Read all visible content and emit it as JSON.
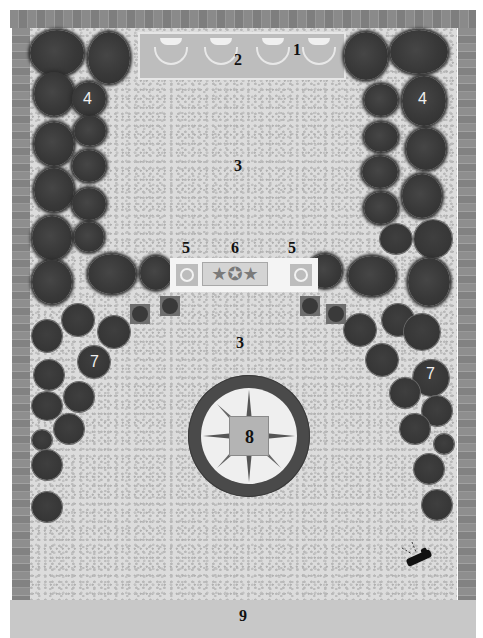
{
  "diagram": {
    "title": "",
    "type": "garden-plan",
    "labels": [
      {
        "id": "1",
        "text": "1",
        "element": "wall-fountains"
      },
      {
        "id": "2",
        "text": "2",
        "element": "raised-planter"
      },
      {
        "id": "3a",
        "text": "3",
        "element": "gravel-upper"
      },
      {
        "id": "3b",
        "text": "3",
        "element": "gravel-lower"
      },
      {
        "id": "4a",
        "text": "4",
        "element": "shrub-left"
      },
      {
        "id": "4b",
        "text": "4",
        "element": "shrub-right"
      },
      {
        "id": "5a",
        "text": "5",
        "element": "urn-left"
      },
      {
        "id": "5b",
        "text": "5",
        "element": "urn-right"
      },
      {
        "id": "6",
        "text": "6",
        "element": "sculpture-panel"
      },
      {
        "id": "7a",
        "text": "7",
        "element": "round-shrub-left"
      },
      {
        "id": "7b",
        "text": "7",
        "element": "round-shrub-right"
      },
      {
        "id": "8",
        "text": "8",
        "element": "compass-centre"
      },
      {
        "id": "9",
        "text": "9",
        "element": "path"
      }
    ],
    "sculpture_glyphs": "★✪★",
    "colors": {
      "wall": "#8a8a8a",
      "gravel": "#dcdcdc",
      "shrub": "#3a3a3a",
      "planter": "#bdbdbd",
      "compass_ring": "#4a4a4a",
      "compass_face": "#efefef",
      "path": "#c8c8c8"
    }
  }
}
